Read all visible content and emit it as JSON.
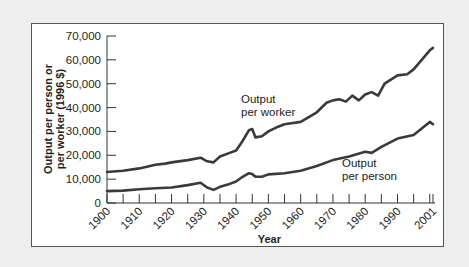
{
  "chart_data": {
    "type": "line",
    "title": "",
    "xlabel": "Year",
    "ylabel_line1": "Output per person or",
    "ylabel_line2": "per worker (1996 $)",
    "ylim": [
      0,
      70000
    ],
    "xlim": [
      1900,
      2001
    ],
    "yticks": [
      "0",
      "10,000",
      "20,000",
      "30,000",
      "40,000",
      "50,000",
      "60,000",
      "70,000"
    ],
    "xticks": [
      "1900",
      "1910",
      "1920",
      "1930",
      "1940",
      "1950",
      "1960",
      "1970",
      "1980",
      "1990",
      "2001"
    ],
    "grid": false,
    "legend": "inline labels",
    "series": [
      {
        "name": "Output per worker",
        "label_line1": "Output",
        "label_line2": "per worker",
        "x": [
          1900,
          1905,
          1910,
          1915,
          1918,
          1920,
          1925,
          1929,
          1931,
          1933,
          1935,
          1938,
          1940,
          1942,
          1944,
          1945,
          1946,
          1948,
          1950,
          1953,
          1955,
          1960,
          1965,
          1968,
          1970,
          1972,
          1974,
          1976,
          1978,
          1980,
          1982,
          1984,
          1986,
          1990,
          1993,
          1995,
          2000,
          2001
        ],
        "values": [
          13000,
          13500,
          14500,
          16000,
          16500,
          17000,
          18000,
          19000,
          17500,
          17000,
          19500,
          21000,
          22000,
          26000,
          30500,
          31000,
          27500,
          28000,
          30000,
          32000,
          33000,
          34000,
          38000,
          42000,
          43000,
          43500,
          42500,
          45000,
          43000,
          45500,
          46500,
          45000,
          50000,
          53500,
          54000,
          56000,
          64000,
          65000
        ]
      },
      {
        "name": "Output per person",
        "label_line1": "Output",
        "label_line2": "per person",
        "x": [
          1900,
          1905,
          1910,
          1915,
          1920,
          1925,
          1929,
          1931,
          1933,
          1935,
          1938,
          1940,
          1942,
          1944,
          1945,
          1946,
          1948,
          1950,
          1955,
          1960,
          1965,
          1970,
          1975,
          1980,
          1982,
          1985,
          1990,
          1995,
          2000,
          2001
        ],
        "values": [
          5000,
          5200,
          5800,
          6200,
          6500,
          7500,
          8500,
          6500,
          5500,
          6800,
          8000,
          9000,
          11000,
          12500,
          12200,
          11000,
          11000,
          12000,
          12500,
          13500,
          15500,
          18000,
          19500,
          21500,
          21000,
          23500,
          27000,
          28500,
          34000,
          33000
        ]
      }
    ]
  }
}
